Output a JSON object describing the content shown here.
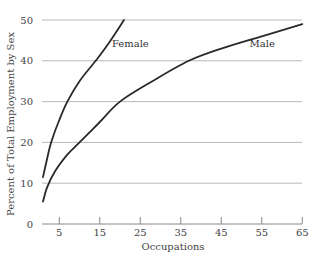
{
  "chart_data": {
    "type": "line",
    "title": "",
    "xlabel": "Occupations",
    "ylabel": "Percent of Total Employment by Sex",
    "xlim": [
      0,
      65
    ],
    "ylim": [
      0,
      50
    ],
    "x_ticks": [
      5,
      15,
      25,
      35,
      45,
      55,
      65
    ],
    "y_ticks": [
      0,
      10,
      20,
      30,
      40,
      50
    ],
    "grid": "horizontal",
    "legend": "inline labels",
    "series": [
      {
        "name": "Female",
        "points": [
          [
            1,
            11.5
          ],
          [
            2,
            16
          ],
          [
            3,
            20
          ],
          [
            5,
            25.5
          ],
          [
            7,
            30
          ],
          [
            10,
            35
          ],
          [
            14,
            40
          ],
          [
            17,
            44
          ],
          [
            21,
            50
          ]
        ]
      },
      {
        "name": "Male",
        "points": [
          [
            1,
            5.5
          ],
          [
            2,
            9
          ],
          [
            4,
            13
          ],
          [
            7,
            17
          ],
          [
            10,
            20
          ],
          [
            15,
            25
          ],
          [
            20,
            30
          ],
          [
            28,
            35
          ],
          [
            37,
            40
          ],
          [
            45,
            43
          ],
          [
            55,
            46
          ],
          [
            65,
            49
          ]
        ]
      }
    ],
    "annotations": [
      {
        "text": "Female",
        "x": 18,
        "y": 43.5
      },
      {
        "text": "Male",
        "x": 52,
        "y": 43.5
      }
    ]
  },
  "colors": {
    "line": "#2a2a2a",
    "grid": "#b8b8b8",
    "axis": "#888888"
  }
}
